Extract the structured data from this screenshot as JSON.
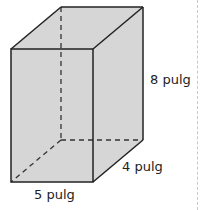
{
  "figure": {
    "shape": "rectangular prism",
    "fill_color": "#d6d6d6",
    "edge_color": "#222222",
    "dimensions": {
      "height_label": "8 pulg",
      "depth_label": "4 pulg",
      "width_label": "5 pulg"
    }
  }
}
